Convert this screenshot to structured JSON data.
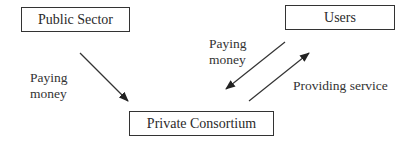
{
  "nodes": {
    "public_sector": "Public Sector",
    "users": "Users",
    "private_consortium": "Private Consortium"
  },
  "edges": [
    {
      "from": "Public Sector",
      "to": "Private Consortium",
      "label_line1": "Paying",
      "label_line2": "money"
    },
    {
      "from": "Users",
      "to": "Private Consortium",
      "label_line1": "Paying",
      "label_line2": "money"
    },
    {
      "from": "Private Consortium",
      "to": "Users",
      "label": "Providing service"
    }
  ]
}
